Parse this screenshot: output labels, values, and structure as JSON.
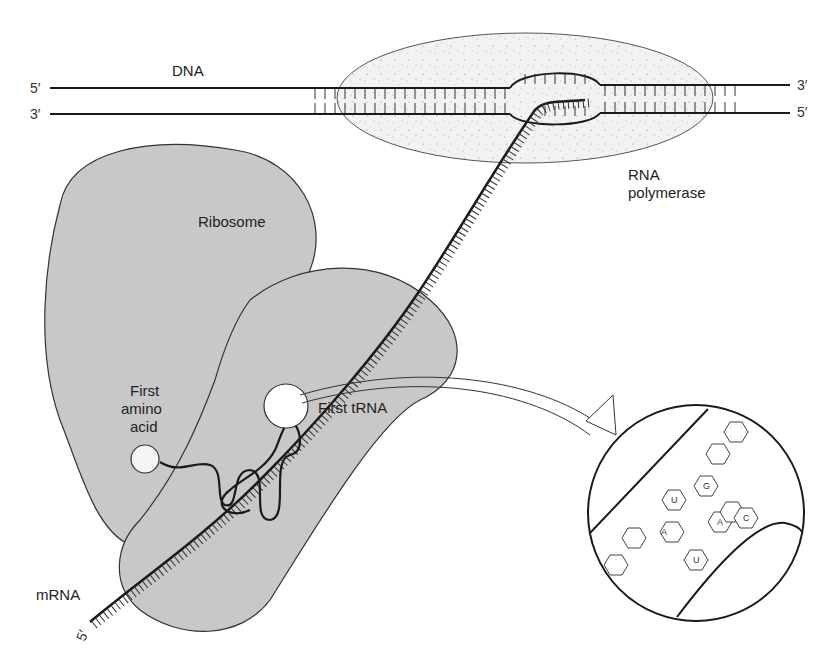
{
  "figure": {
    "labels": {
      "dna": "DNA",
      "top_left_end": "5′",
      "bottom_left_end": "3′",
      "top_right_end": "3′",
      "bottom_right_end": "5′",
      "rna_polymerase_line1": "RNA",
      "rna_polymerase_line2": "polymerase",
      "ribosome": "Ribosome",
      "first_amino_acid_line1": "First",
      "first_amino_acid_line2": "amino",
      "first_amino_acid_line3": "acid",
      "first_trna": "First tRNA",
      "mrna": "mRNA",
      "mrna_end": "5′"
    },
    "inset": {
      "description": "Magnified codon–anticodon pairing",
      "codon_bases": [
        "A",
        "U",
        "G"
      ],
      "anticodon_bases": [
        "U",
        "A",
        "C"
      ]
    },
    "colors": {
      "ribosome_fill": "#c8c8c8",
      "line": "#1a1a1a",
      "polymerase_fill": "#f1f1f1"
    }
  }
}
